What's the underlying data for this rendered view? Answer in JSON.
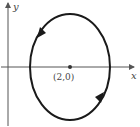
{
  "diagram": {
    "type": "parametric-ellipse",
    "axes": {
      "x_label": "x",
      "y_label": "y"
    },
    "center": {
      "label": "(2,0)",
      "x": 2,
      "y": 0
    },
    "orientation": "counterclockwise",
    "colors": {
      "curve": "#1a1a1a",
      "axis": "#555555",
      "point": "#333333"
    }
  }
}
